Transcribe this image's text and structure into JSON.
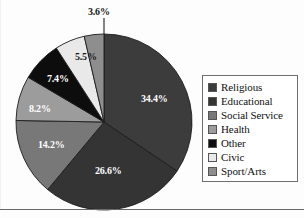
{
  "chart_data": {
    "type": "pie",
    "title": "",
    "subtitle": "",
    "xlabel": "",
    "ylabel": "",
    "legend_position": "right",
    "grid": false,
    "start_angle_deg": 0,
    "direction": "clockwise",
    "categories": [
      "Religious",
      "Educational",
      "Social Service",
      "Health",
      "Other",
      "Civic",
      "Sport/Arts"
    ],
    "values": [
      34.4,
      26.6,
      14.2,
      8.2,
      7.4,
      5.5,
      3.6
    ],
    "value_labels": [
      "34.4%",
      "26.6%",
      "14.2%",
      "8.2%",
      "7.4%",
      "5.5%",
      "3.6%"
    ],
    "units": "percent",
    "colors": [
      "#3c3c3c",
      "#343434",
      "#787878",
      "#9c9c9c",
      "#0d0d0d",
      "#e9e9e9",
      "#8e8e8e"
    ],
    "slices": [
      {
        "label": "Religious",
        "value": 34.4,
        "display": "34.4%",
        "color": "#3c3c3c",
        "label_placement": "inside",
        "label_color": "on-dark"
      },
      {
        "label": "Educational",
        "value": 26.6,
        "display": "26.6%",
        "color": "#343434",
        "label_placement": "inside",
        "label_color": "on-dark"
      },
      {
        "label": "Social Service",
        "value": 14.2,
        "display": "14.2%",
        "color": "#787878",
        "label_placement": "inside",
        "label_color": "on-dark"
      },
      {
        "label": "Health",
        "value": 8.2,
        "display": "8.2%",
        "color": "#9c9c9c",
        "label_placement": "inside",
        "label_color": "on-dark"
      },
      {
        "label": "Other",
        "value": 7.4,
        "display": "7.4%",
        "color": "#0d0d0d",
        "label_placement": "inside",
        "label_color": "on-dark"
      },
      {
        "label": "Civic",
        "value": 5.5,
        "display": "5.5%",
        "color": "#e9e9e9",
        "label_placement": "inside",
        "label_color": "on-light"
      },
      {
        "label": "Sport/Arts",
        "value": 3.6,
        "display": "3.6%",
        "color": "#8e8e8e",
        "label_placement": "outside",
        "label_color": "outside"
      }
    ]
  },
  "legend": {
    "items": [
      {
        "label": "Religious",
        "color": "#3c3c3c"
      },
      {
        "label": "Educational",
        "color": "#343434"
      },
      {
        "label": "Social Service",
        "color": "#787878"
      },
      {
        "label": "Health",
        "color": "#9c9c9c"
      },
      {
        "label": "Other",
        "color": "#0d0d0d"
      },
      {
        "label": "Civic",
        "color": "#e9e9e9"
      },
      {
        "label": "Sport/Arts",
        "color": "#8e8e8e"
      }
    ]
  },
  "labels": {
    "religious_pct": "34.4%",
    "educational_pct": "26.6%",
    "social_service_pct": "14.2%",
    "health_pct": "8.2%",
    "other_pct": "7.4%",
    "civic_pct": "5.5%",
    "sport_arts_pct": "3.6%"
  }
}
